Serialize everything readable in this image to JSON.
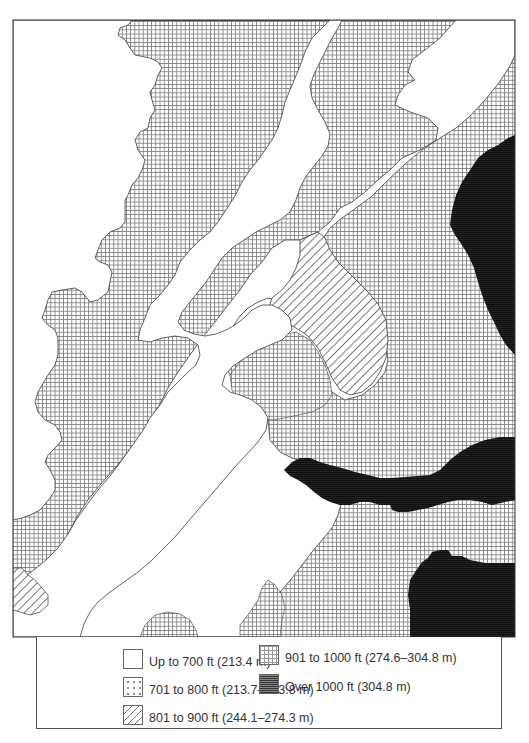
{
  "map": {
    "type": "elevation-zone-map",
    "frame": {
      "left": 13,
      "top": 20,
      "right": 515,
      "bottom": 637
    },
    "zones": [
      {
        "id": "up-to-700",
        "pattern": "blank",
        "color": "#ffffff"
      },
      {
        "id": "701-800",
        "pattern": "dots",
        "color": "#888888"
      },
      {
        "id": "801-900",
        "pattern": "diagonal-hatch",
        "color": "#777777"
      },
      {
        "id": "901-1000",
        "pattern": "grid",
        "color": "#999999"
      },
      {
        "id": "over-1000",
        "pattern": "dense-horizontal",
        "color": "#111111"
      }
    ]
  },
  "legend": {
    "items": [
      {
        "label": "Up to 700 ft (213.4 m)",
        "pattern": "blank"
      },
      {
        "label": "701 to 800 ft (213.7–243.8 m)",
        "pattern": "dots"
      },
      {
        "label": "801 to 900 ft (244.1–274.3 m)",
        "pattern": "diagonal-hatch"
      },
      {
        "label": "901 to 1000 ft (274.6–304.8 m)",
        "pattern": "grid"
      },
      {
        "label": "Over 1000 ft (304.8 m)",
        "pattern": "dense-horizontal"
      }
    ]
  }
}
